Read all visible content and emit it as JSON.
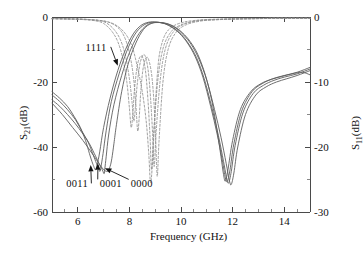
{
  "chart_data": {
    "type": "line",
    "title": "",
    "xlabel": "Frequency (GHz)",
    "ylabel_left": "S21(dB)",
    "ylabel_left_base": "S",
    "ylabel_left_sub": "21",
    "ylabel_left_unit": "(dB)",
    "ylabel_right_base": "S",
    "ylabel_right_sub": "11",
    "ylabel_right_unit": "(dB)",
    "xlim": [
      5,
      15
    ],
    "ylim_left": [
      -60,
      0
    ],
    "ylim_right": [
      -30,
      0
    ],
    "grid": false,
    "legend_position": "none",
    "xticks": [
      6,
      8,
      10,
      12,
      14
    ],
    "xtick_labels": [
      "6",
      "8",
      "10",
      "12",
      "14"
    ],
    "yticks_left": [
      0,
      -20,
      -40,
      -60
    ],
    "ytick_labels_left": [
      "0",
      "-20",
      "-40",
      "-60"
    ],
    "yticks_right": [
      0,
      -10,
      -20,
      -30
    ],
    "ytick_labels_right": [
      "0",
      "-10",
      "-20",
      "-30"
    ],
    "x_minor_ticks": [
      5.5,
      6.5,
      7,
      7.5,
      8.5,
      9,
      9.5,
      10.5,
      11,
      11.5,
      12.5,
      13,
      13.5,
      14.5
    ],
    "y_minor_ticks_left": [
      -10,
      -30,
      -50
    ],
    "y_minor_ticks_right": [
      -5,
      -15,
      -25
    ],
    "annotations": [
      {
        "text": "1111",
        "x": 6.3,
        "y": -9.5,
        "arrow_to_x": 7.55,
        "arrow_to_y": -15.0
      },
      {
        "text": "0011",
        "x": 5.55,
        "y": -51.5,
        "arrow_to_x": 6.5,
        "arrow_to_y": -45.5
      },
      {
        "text": "0001",
        "x": 6.85,
        "y": -51.5,
        "arrow_to_x": 6.78,
        "arrow_to_y": -45.0
      },
      {
        "text": "0000",
        "x": 8.05,
        "y": -51.5,
        "arrow_to_x": 7.05,
        "arrow_to_y": -46.5
      }
    ],
    "series": [
      {
        "name": "S21 state 0000",
        "param": "S21",
        "state": "0000",
        "style": "solid",
        "color": "#5d5d5d",
        "axis": "left",
        "x": [
          5.0,
          5.3,
          5.6,
          5.9,
          6.2,
          6.45,
          6.7,
          6.85,
          6.95,
          7.02,
          7.05,
          7.1,
          7.2,
          7.4,
          7.7,
          8.0,
          8.3,
          8.6,
          8.9,
          9.2,
          9.5,
          9.8,
          10.1,
          10.4,
          10.7,
          11.0,
          11.3,
          11.55,
          11.75,
          11.88,
          11.95,
          12.05,
          12.2,
          12.5,
          12.9,
          13.3,
          13.7,
          14.1,
          14.5,
          15.0
        ],
        "y": [
          -25.5,
          -27.5,
          -30.0,
          -32.8,
          -36.0,
          -39.0,
          -43.0,
          -45.5,
          -47.0,
          -48.2,
          -46.5,
          -43.0,
          -36.0,
          -27.0,
          -18.0,
          -11.0,
          -6.0,
          -3.0,
          -1.8,
          -1.7,
          -2.2,
          -3.4,
          -5.5,
          -8.5,
          -13.0,
          -19.5,
          -28.5,
          -37.0,
          -45.0,
          -50.5,
          -51.5,
          -48.0,
          -40.0,
          -30.0,
          -24.0,
          -21.5,
          -20.0,
          -19.0,
          -18.0,
          -16.5
        ]
      },
      {
        "name": "S21 state 0001",
        "param": "S21",
        "state": "0001",
        "style": "solid",
        "color": "#5d5d5d",
        "axis": "left",
        "x": [
          5.0,
          5.3,
          5.6,
          5.9,
          6.15,
          6.4,
          6.6,
          6.72,
          6.8,
          6.86,
          6.9,
          6.98,
          7.1,
          7.3,
          7.6,
          7.9,
          8.2,
          8.5,
          8.8,
          9.1,
          9.4,
          9.7,
          10.0,
          10.3,
          10.6,
          10.9,
          11.2,
          11.45,
          11.65,
          11.78,
          11.85,
          11.95,
          12.1,
          12.4,
          12.8,
          13.2,
          13.6,
          14.0,
          14.5,
          15.0
        ],
        "y": [
          -24.0,
          -26.0,
          -28.5,
          -31.5,
          -35.0,
          -38.5,
          -42.5,
          -45.0,
          -46.5,
          -47.5,
          -46.0,
          -42.0,
          -35.0,
          -26.0,
          -17.5,
          -10.5,
          -5.5,
          -2.8,
          -1.7,
          -1.6,
          -2.1,
          -3.3,
          -5.3,
          -8.3,
          -12.5,
          -19.0,
          -28.0,
          -36.5,
          -44.5,
          -50.0,
          -51.0,
          -47.5,
          -39.5,
          -29.5,
          -23.5,
          -21.0,
          -19.5,
          -18.5,
          -17.5,
          -16.0
        ]
      },
      {
        "name": "S21 state 0011",
        "param": "S21",
        "state": "0011",
        "style": "solid",
        "color": "#5d5d5d",
        "axis": "left",
        "x": [
          5.0,
          5.3,
          5.6,
          5.85,
          6.1,
          6.3,
          6.45,
          6.55,
          6.62,
          6.68,
          6.75,
          6.85,
          7.0,
          7.25,
          7.55,
          7.85,
          8.15,
          8.45,
          8.75,
          9.05,
          9.35,
          9.65,
          9.95,
          10.25,
          10.55,
          10.85,
          11.15,
          11.4,
          11.6,
          11.72,
          11.8,
          11.9,
          12.05,
          12.35,
          12.75,
          13.15,
          13.55,
          14.0,
          14.5,
          15.0
        ],
        "y": [
          -23.0,
          -25.0,
          -27.5,
          -30.5,
          -34.0,
          -38.0,
          -42.0,
          -44.5,
          -46.0,
          -47.0,
          -45.5,
          -41.5,
          -34.0,
          -25.0,
          -16.5,
          -10.0,
          -5.2,
          -2.6,
          -1.6,
          -1.6,
          -2.0,
          -3.2,
          -5.1,
          -8.0,
          -12.2,
          -18.5,
          -27.5,
          -36.0,
          -44.0,
          -49.5,
          -50.5,
          -47.0,
          -39.0,
          -29.0,
          -23.0,
          -20.5,
          -19.0,
          -18.0,
          -17.0,
          -15.5
        ]
      },
      {
        "name": "S21 state 1111",
        "param": "S21",
        "state": "1111",
        "style": "solid",
        "color": "#5d5d5d",
        "axis": "left",
        "x": [
          5.0,
          5.4,
          5.8,
          6.2,
          6.6,
          6.95,
          7.15,
          7.25,
          7.32,
          7.4,
          7.5,
          7.7,
          7.95,
          8.25,
          8.55,
          8.85,
          9.15,
          9.45,
          9.75,
          10.05,
          10.35,
          10.65,
          10.95,
          11.2,
          11.4,
          11.55,
          11.65,
          11.72,
          11.82,
          12.0,
          12.3,
          12.7,
          13.1,
          13.5,
          13.9,
          14.3,
          14.7,
          15.0
        ],
        "y": [
          -26.5,
          -30.0,
          -34.0,
          -38.0,
          -42.5,
          -46.5,
          -47.5,
          -46.0,
          -43.5,
          -39.0,
          -33.0,
          -23.0,
          -14.5,
          -8.0,
          -3.8,
          -2.0,
          -1.7,
          -2.0,
          -3.0,
          -4.8,
          -7.5,
          -11.5,
          -18.0,
          -26.0,
          -35.0,
          -43.0,
          -48.5,
          -50.5,
          -47.0,
          -38.0,
          -28.5,
          -23.0,
          -20.5,
          -19.2,
          -18.3,
          -17.5,
          -17.0,
          -17.8
        ]
      },
      {
        "name": "S11 state 0000",
        "param": "S11",
        "state": "0000",
        "style": "dashed",
        "color": "#8e8e8e",
        "axis": "right",
        "x": [
          5.0,
          5.6,
          6.2,
          6.8,
          7.2,
          7.55,
          7.8,
          8.0,
          8.15,
          8.25,
          8.32,
          8.38,
          8.45,
          8.55,
          8.7,
          8.85,
          8.95,
          9.02,
          9.08,
          9.15,
          9.3,
          9.5,
          9.8,
          10.2,
          10.8,
          11.5,
          12.2,
          13.0,
          13.8,
          14.4,
          15.0
        ],
        "y": [
          -0.25,
          -0.3,
          -0.35,
          -0.5,
          -0.8,
          -1.6,
          -3.0,
          -5.5,
          -9.0,
          -13.5,
          -17.5,
          -15.5,
          -11.0,
          -7.5,
          -6.2,
          -8.5,
          -13.0,
          -19.0,
          -24.5,
          -19.0,
          -10.0,
          -5.0,
          -2.4,
          -1.2,
          -0.6,
          -0.4,
          -0.3,
          -0.25,
          -0.2,
          -0.2,
          -0.2
        ]
      },
      {
        "name": "S11 state 0001",
        "param": "S11",
        "state": "0001",
        "style": "dashed",
        "color": "#8e8e8e",
        "axis": "right",
        "x": [
          5.0,
          5.6,
          6.2,
          6.8,
          7.1,
          7.4,
          7.65,
          7.85,
          8.0,
          8.1,
          8.17,
          8.23,
          8.3,
          8.42,
          8.58,
          8.72,
          8.82,
          8.9,
          8.96,
          9.04,
          9.2,
          9.4,
          9.7,
          10.1,
          10.7,
          11.4,
          12.1,
          12.9,
          13.7,
          14.4,
          15.0
        ],
        "y": [
          -0.25,
          -0.3,
          -0.35,
          -0.55,
          -0.9,
          -1.9,
          -3.5,
          -6.0,
          -9.5,
          -13.0,
          -16.0,
          -14.0,
          -10.5,
          -7.0,
          -5.8,
          -8.0,
          -12.5,
          -18.0,
          -23.0,
          -17.5,
          -9.5,
          -4.8,
          -2.3,
          -1.15,
          -0.55,
          -0.4,
          -0.3,
          -0.25,
          -0.2,
          -0.2,
          -0.2
        ]
      },
      {
        "name": "S11 state 0011",
        "param": "S11",
        "state": "0011",
        "style": "dashed",
        "color": "#8e8e8e",
        "axis": "right",
        "x": [
          5.0,
          5.6,
          6.2,
          6.7,
          7.0,
          7.3,
          7.55,
          7.75,
          7.9,
          8.0,
          8.07,
          8.13,
          8.2,
          8.32,
          8.48,
          8.62,
          8.72,
          8.8,
          8.86,
          8.94,
          9.1,
          9.3,
          9.6,
          10.0,
          10.6,
          11.3,
          12.0,
          12.8,
          13.6,
          14.3,
          15.0
        ],
        "y": [
          -0.25,
          -0.3,
          -0.4,
          -0.6,
          -1.0,
          -2.1,
          -3.8,
          -6.5,
          -10.0,
          -14.0,
          -17.0,
          -15.0,
          -11.0,
          -7.2,
          -6.0,
          -8.2,
          -12.8,
          -18.5,
          -23.5,
          -18.0,
          -9.8,
          -4.9,
          -2.35,
          -1.2,
          -0.6,
          -0.4,
          -0.3,
          -0.25,
          -0.2,
          -0.2,
          -0.2
        ]
      },
      {
        "name": "S11 state 1111",
        "param": "S11",
        "state": "1111",
        "style": "dashed",
        "color": "#8e8e8e",
        "axis": "right",
        "x": [
          5.0,
          5.8,
          6.5,
          7.1,
          7.5,
          7.85,
          8.1,
          8.3,
          8.5,
          8.65,
          8.75,
          8.82,
          8.9,
          9.0,
          9.1,
          9.2,
          9.4,
          9.7,
          10.1,
          10.6,
          11.2,
          11.9,
          12.7,
          13.5,
          14.3,
          15.0
        ],
        "y": [
          -0.25,
          -0.3,
          -0.4,
          -0.7,
          -1.3,
          -2.6,
          -4.5,
          -7.5,
          -11.5,
          -16.0,
          -21.0,
          -25.5,
          -22.0,
          -14.0,
          -8.0,
          -5.0,
          -2.6,
          -1.4,
          -0.8,
          -0.5,
          -0.35,
          -0.3,
          -0.25,
          -0.2,
          -0.2,
          -0.2
        ]
      }
    ]
  },
  "figure": {
    "x_axis_title": "Frequency (GHz)"
  }
}
